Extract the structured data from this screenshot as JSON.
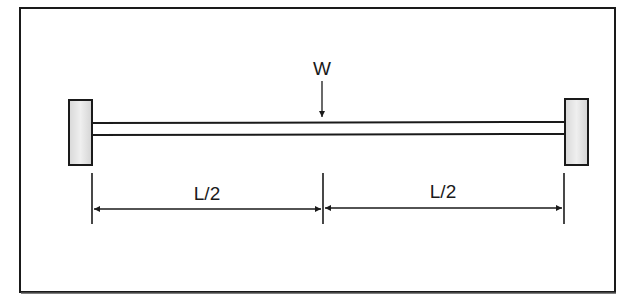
{
  "diagram": {
    "type": "simply-supported-beam-point-load",
    "load": {
      "label": "W",
      "position": "midspan"
    },
    "dimensions": [
      {
        "label": "L/2",
        "segment": "left-half"
      },
      {
        "label": "L/2",
        "segment": "right-half"
      }
    ],
    "supports": [
      "left-fixed-block",
      "right-fixed-block"
    ],
    "colors": {
      "stroke": "#1a1a1a",
      "support_fill": "#e4e4e4",
      "background": "#ffffff"
    }
  }
}
